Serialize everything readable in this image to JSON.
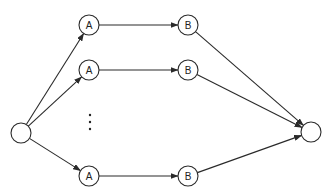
{
  "diagram": {
    "type": "flow-network",
    "stroke_color": "#2a2a2a",
    "background": "#ffffff",
    "source": {
      "label": "",
      "x": 21,
      "y": 133,
      "r": 10
    },
    "sink": {
      "label": "",
      "x": 311,
      "y": 132,
      "r": 10
    },
    "paths": [
      {
        "a": {
          "label": "A",
          "x": 89,
          "y": 25,
          "r": 10
        },
        "b": {
          "label": "B",
          "x": 188,
          "y": 25,
          "r": 10
        }
      },
      {
        "a": {
          "label": "A",
          "x": 89,
          "y": 70,
          "r": 10
        },
        "b": {
          "label": "B",
          "x": 188,
          "y": 70,
          "r": 10
        }
      },
      {
        "a": {
          "label": "A",
          "x": 89,
          "y": 176,
          "r": 10
        },
        "b": {
          "label": "B",
          "x": 188,
          "y": 176,
          "r": 10
        }
      }
    ],
    "ellipsis": {
      "x": 90,
      "ys": [
        115,
        122,
        129
      ],
      "symbol": "⋮"
    }
  }
}
